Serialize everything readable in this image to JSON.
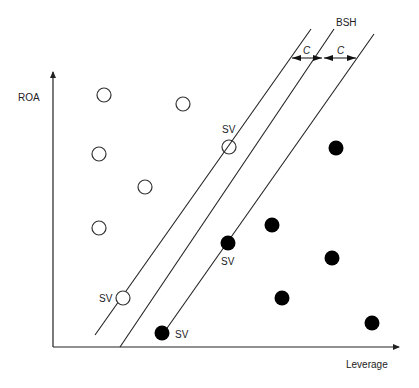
{
  "diagram": {
    "axes": {
      "y_label": "ROA",
      "x_label": "Leverage"
    },
    "hyperplane_label": "BSH",
    "margin_labels": [
      "C",
      "C"
    ],
    "support_vector_label": "SV",
    "colors": {
      "line": "#222222",
      "filled_point": "#000000",
      "open_point_fill": "#ffffff"
    },
    "open_points": [
      {
        "x": 104,
        "y": 95,
        "sv": false
      },
      {
        "x": 183,
        "y": 104,
        "sv": false
      },
      {
        "x": 99,
        "y": 154,
        "sv": false
      },
      {
        "x": 145,
        "y": 187,
        "sv": false
      },
      {
        "x": 99,
        "y": 228,
        "sv": false
      },
      {
        "x": 229,
        "y": 147,
        "sv": true
      },
      {
        "x": 123,
        "y": 298,
        "sv": true
      }
    ],
    "filled_points": [
      {
        "x": 336,
        "y": 148,
        "sv": false
      },
      {
        "x": 272,
        "y": 225,
        "sv": false
      },
      {
        "x": 332,
        "y": 258,
        "sv": false
      },
      {
        "x": 282,
        "y": 298,
        "sv": false
      },
      {
        "x": 372,
        "y": 323,
        "sv": false
      },
      {
        "x": 228,
        "y": 243,
        "sv": true
      },
      {
        "x": 162,
        "y": 333,
        "sv": true
      }
    ]
  }
}
